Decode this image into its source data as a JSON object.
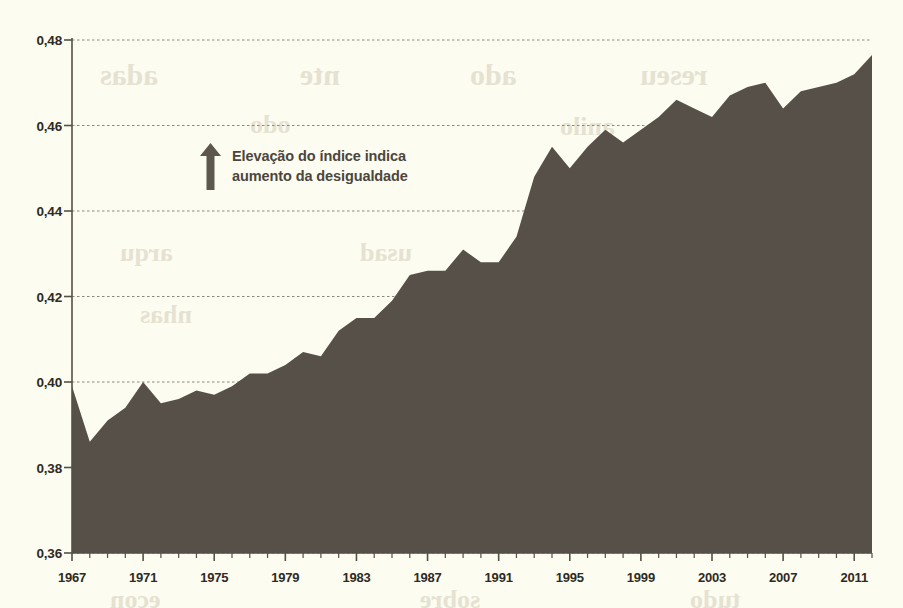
{
  "chart_data": {
    "type": "area",
    "title": "",
    "subtitle": "",
    "xlabel": "",
    "ylabel": "",
    "xlim": [
      1967,
      2012
    ],
    "ylim": [
      0.36,
      0.48
    ],
    "grid": true,
    "legend_position": "none",
    "y_ticks": [
      "0,48",
      "0,46",
      "0,44",
      "0,42",
      "0,40",
      "0,38",
      "0,36"
    ],
    "y_tick_values": [
      0.48,
      0.46,
      0.44,
      0.42,
      0.4,
      0.38,
      0.36
    ],
    "x_ticks": [
      "1967",
      "1971",
      "1975",
      "1979",
      "1983",
      "1987",
      "1991",
      "1995",
      "1999",
      "2003",
      "2007",
      "2011"
    ],
    "x_tick_values": [
      1967,
      1971,
      1975,
      1979,
      1983,
      1987,
      1991,
      1995,
      1999,
      2003,
      2007,
      2011
    ],
    "x": [
      1967,
      1968,
      1969,
      1970,
      1971,
      1972,
      1973,
      1974,
      1975,
      1976,
      1977,
      1978,
      1979,
      1980,
      1981,
      1982,
      1983,
      1984,
      1985,
      1986,
      1987,
      1988,
      1989,
      1990,
      1991,
      1992,
      1993,
      1994,
      1995,
      1996,
      1997,
      1998,
      1999,
      2000,
      2001,
      2002,
      2003,
      2004,
      2005,
      2006,
      2007,
      2008,
      2009,
      2010,
      2011,
      2012
    ],
    "values": [
      0.399,
      0.386,
      0.391,
      0.394,
      0.4,
      0.395,
      0.396,
      0.398,
      0.397,
      0.399,
      0.402,
      0.402,
      0.404,
      0.407,
      0.406,
      0.412,
      0.415,
      0.415,
      0.419,
      0.425,
      0.426,
      0.426,
      0.431,
      0.428,
      0.428,
      0.434,
      0.448,
      0.455,
      0.45,
      0.455,
      0.459,
      0.456,
      0.459,
      0.462,
      0.466,
      0.464,
      0.462,
      0.467,
      0.469,
      0.47,
      0.464,
      0.468,
      0.469,
      0.47,
      0.472,
      0.4765
    ],
    "series": [
      {
        "name": "Índice de Gini",
        "values": [
          0.399,
          0.386,
          0.391,
          0.394,
          0.4,
          0.395,
          0.396,
          0.398,
          0.397,
          0.399,
          0.402,
          0.402,
          0.404,
          0.407,
          0.406,
          0.412,
          0.415,
          0.415,
          0.419,
          0.425,
          0.426,
          0.426,
          0.431,
          0.428,
          0.428,
          0.434,
          0.448,
          0.455,
          0.45,
          0.455,
          0.459,
          0.456,
          0.459,
          0.462,
          0.466,
          0.464,
          0.462,
          0.467,
          0.469,
          0.47,
          0.464,
          0.468,
          0.469,
          0.47,
          0.472,
          0.4765
        ]
      }
    ],
    "annotations": [
      {
        "icon": "up-arrow-icon",
        "text": "Elevação do índice indica\naumento da desigualdade"
      }
    ],
    "colors": {
      "area_fill": "#565049",
      "background": "#fdfcf0",
      "axis": "#55504a",
      "grid": "#8d887c",
      "label": "#2e2a24",
      "annotation_text": "#4b463d",
      "annotation_arrow": "#5d574e"
    }
  },
  "bleed_text": [
    {
      "text": "adas",
      "x": 100,
      "y": 58,
      "size": 30
    },
    {
      "text": "nte",
      "x": 300,
      "y": 58,
      "size": 30
    },
    {
      "text": "ado",
      "x": 470,
      "y": 58,
      "size": 30
    },
    {
      "text": "reseu",
      "x": 640,
      "y": 58,
      "size": 30
    },
    {
      "text": "odo",
      "x": 250,
      "y": 110,
      "size": 26
    },
    {
      "text": "anilo",
      "x": 560,
      "y": 112,
      "size": 26
    },
    {
      "text": "arqu",
      "x": 120,
      "y": 238,
      "size": 26
    },
    {
      "text": "usad",
      "x": 360,
      "y": 238,
      "size": 26
    },
    {
      "text": "para",
      "x": 600,
      "y": 238,
      "size": 26
    },
    {
      "text": "nhas",
      "x": 140,
      "y": 300,
      "size": 26
    },
    {
      "text": "olho",
      "x": 420,
      "y": 300,
      "size": 26
    },
    {
      "text": "mesmo",
      "x": 660,
      "y": 300,
      "size": 26
    },
    {
      "text": "econ",
      "x": 110,
      "y": 585,
      "size": 26
    },
    {
      "text": "sobre",
      "x": 420,
      "y": 585,
      "size": 26
    },
    {
      "text": "tudo",
      "x": 690,
      "y": 585,
      "size": 26
    }
  ]
}
